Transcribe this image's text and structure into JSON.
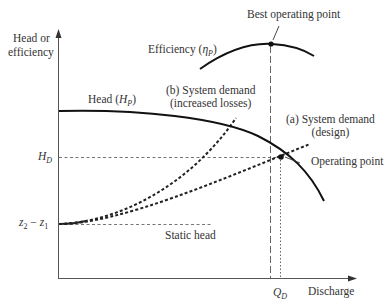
{
  "diagram": {
    "type": "pump-system-curve",
    "axes": {
      "y_label_line1": "Head or",
      "y_label_line2": "efficiency",
      "x_label": "Discharge"
    },
    "curves": {
      "head": {
        "label_prefix": "Head (",
        "label_symbol": "H",
        "label_sub": "P",
        "label_suffix": ")"
      },
      "efficiency": {
        "label_prefix": "Efficiency (",
        "label_symbol": "η",
        "label_sub": "P",
        "label_suffix": ")"
      },
      "system_design": {
        "line1": "(a) System demand",
        "line2": "(design)"
      },
      "system_increased": {
        "line1": "(b) System demand",
        "line2": "(increased losses)"
      }
    },
    "annotations": {
      "best_operating_point": "Best operating point",
      "operating_point": "Operating point",
      "static_head": "Static head"
    },
    "axis_marks": {
      "hd_symbol": "H",
      "hd_sub": "D",
      "z_expr_a": "z",
      "z_expr_a_sub": "2",
      "z_expr_minus": " − ",
      "z_expr_b": "z",
      "z_expr_b_sub": "1",
      "qd_symbol": "Q",
      "qd_sub": "D"
    },
    "colors": {
      "line": "#1a1a1a",
      "axis": "#555555",
      "guide": "#666666"
    }
  }
}
